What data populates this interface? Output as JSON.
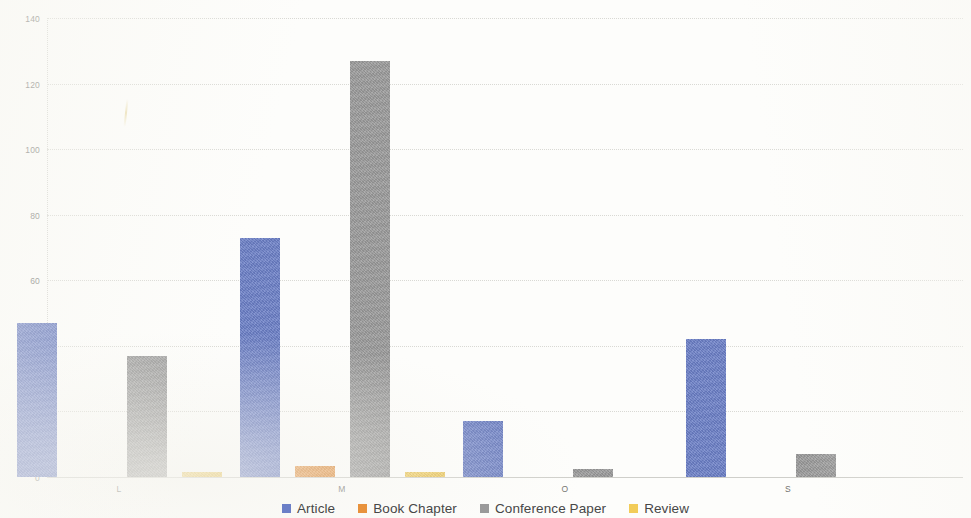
{
  "chart_data": {
    "type": "bar",
    "title": "",
    "subtitle": "",
    "xlabel": "",
    "ylabel": "",
    "categories": [
      "L",
      "M",
      "O",
      "S"
    ],
    "series": [
      {
        "name": "Article",
        "color": "#6b7fc7",
        "values": [
          47,
          73,
          17,
          42
        ]
      },
      {
        "name": "Book Chapter",
        "color": "#e8923c",
        "values": [
          0,
          3.5,
          0,
          0
        ]
      },
      {
        "name": "Conference Paper",
        "color": "#9a9a9a",
        "values": [
          37,
          127,
          2.5,
          7
        ]
      },
      {
        "name": "Review",
        "color": "#f2cc59",
        "values": [
          1.5,
          1.5,
          0,
          0
        ]
      }
    ],
    "ylim": [
      0,
      140
    ],
    "ytick_step": 20,
    "yticks": [
      "0",
      "20",
      "40",
      "60",
      "80",
      "100",
      "120",
      "140"
    ],
    "grid": true,
    "legend_position": "bottom"
  },
  "legend": {
    "items": [
      {
        "label": "Article",
        "swatch": "legend-swatch-article"
      },
      {
        "label": "Book Chapter",
        "swatch": "legend-swatch-book-chapter"
      },
      {
        "label": "Conference Paper",
        "swatch": "legend-swatch-conference-paper"
      },
      {
        "label": "Review",
        "swatch": "legend-swatch-review"
      }
    ]
  }
}
